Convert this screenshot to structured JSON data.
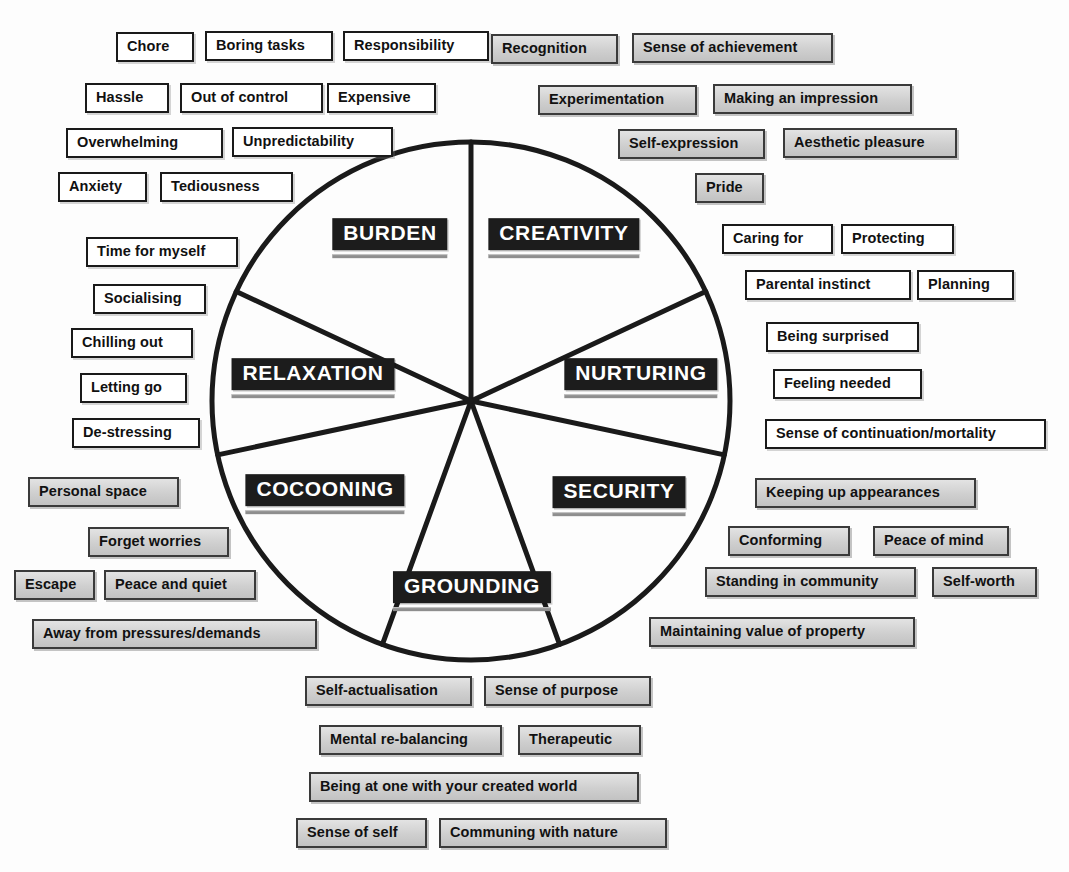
{
  "diagram": {
    "type": "segmented-circle",
    "center": {
      "x": 471,
      "y": 401
    },
    "radius": 259,
    "stroke_color": "#1a1a1a",
    "chip_white_fill": "#ffffff",
    "chip_grey_fill": "#d2d2d2",
    "core_chip_fill": "#1c1c1c",
    "core_chip_text_color": "#ffffff"
  },
  "sectors": [
    {
      "id": "burden",
      "label": "BURDEN",
      "label_x": 390,
      "label_y": 238,
      "start_deg": -90,
      "end_deg": -155
    },
    {
      "id": "creativity",
      "label": "CREATIVITY",
      "label_x": 564,
      "label_y": 238,
      "start_deg": -90,
      "end_deg": -25
    },
    {
      "id": "relaxation",
      "label": "RELAXATION",
      "label_x": 313,
      "label_y": 378,
      "start_deg": -155,
      "end_deg": 168
    },
    {
      "id": "nurturing",
      "label": "NURTURING",
      "label_x": 641,
      "label_y": 378,
      "start_deg": -25,
      "end_deg": 12
    },
    {
      "id": "cocooning",
      "label": "COCOONING",
      "label_x": 325,
      "label_y": 494,
      "start_deg": 168,
      "end_deg": 110
    },
    {
      "id": "security",
      "label": "SECURITY",
      "label_x": 619,
      "label_y": 496,
      "start_deg": 12,
      "end_deg": 70
    },
    {
      "id": "grounding",
      "label": "GROUNDING",
      "label_x": 472,
      "label_y": 591,
      "start_deg": 110,
      "end_deg": 70
    }
  ],
  "clusters": [
    {
      "sector": "burden",
      "style": "white",
      "items": [
        {
          "text": "Chore",
          "x": 116,
          "y": 32,
          "w": 78
        },
        {
          "text": "Boring tasks",
          "x": 205,
          "y": 31,
          "w": 128
        },
        {
          "text": "Responsibility",
          "x": 343,
          "y": 31,
          "w": 146
        },
        {
          "text": "Hassle",
          "x": 85,
          "y": 83,
          "w": 84
        },
        {
          "text": "Out of control",
          "x": 180,
          "y": 83,
          "w": 143
        },
        {
          "text": "Expensive",
          "x": 327,
          "y": 83,
          "w": 109
        },
        {
          "text": "Overwhelming",
          "x": 66,
          "y": 128,
          "w": 157
        },
        {
          "text": "Unpredictability",
          "x": 232,
          "y": 127,
          "w": 161
        },
        {
          "text": "Anxiety",
          "x": 58,
          "y": 172,
          "w": 89
        },
        {
          "text": "Tediousness",
          "x": 160,
          "y": 172,
          "w": 133
        }
      ]
    },
    {
      "sector": "creativity",
      "style": "grey",
      "items": [
        {
          "text": "Recognition",
          "x": 491,
          "y": 34,
          "w": 127
        },
        {
          "text": "Sense of achievement",
          "x": 632,
          "y": 33,
          "w": 201
        },
        {
          "text": "Experimentation",
          "x": 538,
          "y": 85,
          "w": 159
        },
        {
          "text": "Making an impression",
          "x": 713,
          "y": 84,
          "w": 199
        },
        {
          "text": "Self-expression",
          "x": 618,
          "y": 129,
          "w": 147
        },
        {
          "text": "Aesthetic pleasure",
          "x": 783,
          "y": 128,
          "w": 174
        },
        {
          "text": "Pride",
          "x": 695,
          "y": 173,
          "w": 69
        }
      ]
    },
    {
      "sector": "relaxation",
      "style": "white",
      "items": [
        {
          "text": "Time for myself",
          "x": 86,
          "y": 237,
          "w": 152
        },
        {
          "text": "Socialising",
          "x": 93,
          "y": 284,
          "w": 113
        },
        {
          "text": "Chilling out",
          "x": 71,
          "y": 328,
          "w": 122
        },
        {
          "text": "Letting go",
          "x": 80,
          "y": 373,
          "w": 107
        },
        {
          "text": "De-stressing",
          "x": 72,
          "y": 418,
          "w": 128
        }
      ]
    },
    {
      "sector": "nurturing",
      "style": "white",
      "items": [
        {
          "text": "Caring for",
          "x": 722,
          "y": 224,
          "w": 111
        },
        {
          "text": "Protecting",
          "x": 841,
          "y": 224,
          "w": 113
        },
        {
          "text": "Parental instinct",
          "x": 745,
          "y": 270,
          "w": 166
        },
        {
          "text": "Planning",
          "x": 917,
          "y": 270,
          "w": 97
        },
        {
          "text": "Being surprised",
          "x": 766,
          "y": 322,
          "w": 153
        },
        {
          "text": "Feeling needed",
          "x": 773,
          "y": 369,
          "w": 149
        },
        {
          "text": "Sense of continuation/mortality",
          "x": 765,
          "y": 419,
          "w": 281
        }
      ]
    },
    {
      "sector": "cocooning",
      "style": "grey",
      "items": [
        {
          "text": "Personal space",
          "x": 28,
          "y": 477,
          "w": 151
        },
        {
          "text": "Forget worries",
          "x": 88,
          "y": 527,
          "w": 141
        },
        {
          "text": "Escape",
          "x": 14,
          "y": 570,
          "w": 81
        },
        {
          "text": "Peace and quiet",
          "x": 104,
          "y": 570,
          "w": 152
        },
        {
          "text": "Away from pressures/demands",
          "x": 32,
          "y": 619,
          "w": 285
        }
      ]
    },
    {
      "sector": "security",
      "style": "grey",
      "items": [
        {
          "text": "Keeping up appearances",
          "x": 755,
          "y": 478,
          "w": 221
        },
        {
          "text": "Conforming",
          "x": 728,
          "y": 526,
          "w": 122
        },
        {
          "text": "Peace of mind",
          "x": 873,
          "y": 526,
          "w": 136
        },
        {
          "text": "Standing in community",
          "x": 705,
          "y": 567,
          "w": 211
        },
        {
          "text": "Self-worth",
          "x": 932,
          "y": 567,
          "w": 105
        },
        {
          "text": "Maintaining value of property",
          "x": 649,
          "y": 617,
          "w": 266
        }
      ]
    },
    {
      "sector": "grounding",
      "style": "grey",
      "items": [
        {
          "text": "Self-actualisation",
          "x": 305,
          "y": 676,
          "w": 167
        },
        {
          "text": "Sense of purpose",
          "x": 484,
          "y": 676,
          "w": 167
        },
        {
          "text": "Mental re-balancing",
          "x": 319,
          "y": 725,
          "w": 183
        },
        {
          "text": "Therapeutic",
          "x": 518,
          "y": 725,
          "w": 123
        },
        {
          "text": "Being at one with your created world",
          "x": 309,
          "y": 772,
          "w": 330
        },
        {
          "text": "Sense of self",
          "x": 296,
          "y": 818,
          "w": 131
        },
        {
          "text": "Communing with nature",
          "x": 439,
          "y": 818,
          "w": 228
        }
      ]
    }
  ]
}
